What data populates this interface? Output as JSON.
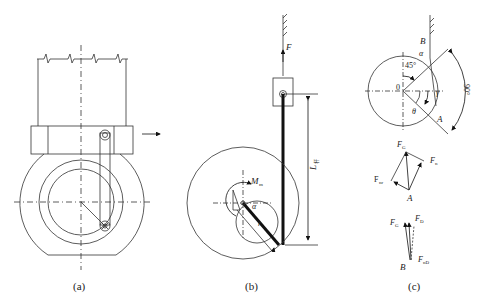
{
  "panels": {
    "a": {
      "caption": "(a)"
    },
    "b": {
      "caption": "(b)",
      "labels": {
        "force": "F",
        "moment": "M",
        "moment_sub": "m",
        "length": "L",
        "length_sub": "杆",
        "radius": "r",
        "angle": "α"
      }
    },
    "c": {
      "caption": "(c)",
      "top": {
        "point_b": "B",
        "point_o": "0",
        "point_a": "A",
        "alpha": "α",
        "angle45": "45°",
        "angle90": "90°",
        "gamma": "γ",
        "theta": "θ"
      },
      "force_diagram_a": {
        "fg": "F",
        "fg_sub": "G",
        "fn": "F",
        "fn_sub": "n",
        "fnr": "F",
        "fnr_sub": "nr",
        "point": "A"
      },
      "force_diagram_b": {
        "fg": "F",
        "fg_sub": "G",
        "fd": "F",
        "fd_sub": "D",
        "fnd": "F",
        "fnd_sub": "nD",
        "point": "B"
      }
    }
  }
}
